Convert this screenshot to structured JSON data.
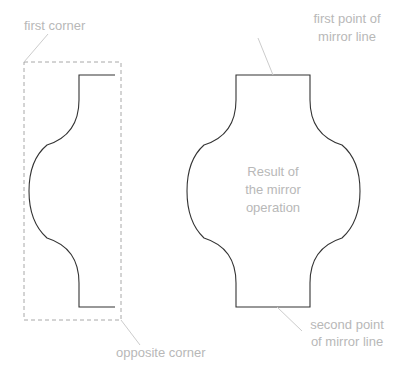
{
  "diagram": {
    "labels": {
      "first_corner": "first corner",
      "first_point_line1": "first point of",
      "first_point_line2": "mirror line",
      "result_line1": "Result of",
      "result_line2": "the mirror",
      "result_line3": "operation",
      "opposite_corner": "opposite corner",
      "second_point_line1": "second point",
      "second_point_line2": "of mirror line"
    },
    "colors": {
      "shape_stroke": "#333333",
      "selection_dash": "#a8a8a8",
      "leader": "#cccccc",
      "label_text": "#b8b8b8"
    }
  }
}
